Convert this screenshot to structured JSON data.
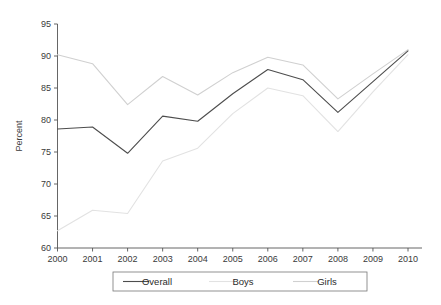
{
  "chart_data": {
    "type": "line",
    "title": "",
    "xlabel": "",
    "ylabel": "Percent",
    "categories": [
      "2000",
      "2001",
      "2002",
      "2003",
      "2004",
      "2005",
      "2006",
      "2007",
      "2008",
      "2009",
      "2010"
    ],
    "x": [
      2000,
      2001,
      2002,
      2003,
      2004,
      2005,
      2006,
      2007,
      2008,
      2009,
      2010
    ],
    "xlim": [
      2000,
      2010
    ],
    "ylim": [
      60,
      95
    ],
    "yticks": [
      60,
      65,
      70,
      75,
      80,
      85,
      90,
      95
    ],
    "ytick_labels": [
      "60",
      "65",
      "70",
      "75",
      "80",
      "85",
      "90",
      "95"
    ],
    "grid": false,
    "legend_position": "bottom",
    "series": [
      {
        "name": "Overall",
        "color": "#4d4d4d",
        "values": [
          78.6,
          78.9,
          74.8,
          80.6,
          79.8,
          84.1,
          87.9,
          86.3,
          81.2,
          86.0,
          90.8
        ]
      },
      {
        "name": "Boys",
        "color": "#e2e2e2",
        "values": [
          62.7,
          65.9,
          65.4,
          73.6,
          75.6,
          81.0,
          85.0,
          83.8,
          78.2,
          84.4,
          90.2
        ]
      },
      {
        "name": "Girls",
        "color": "#d0d0d0",
        "values": [
          90.2,
          88.8,
          82.4,
          86.8,
          83.9,
          87.4,
          89.8,
          88.6,
          83.3,
          87.2,
          91.0
        ]
      }
    ]
  },
  "legend": {
    "items": [
      {
        "label": "Overall"
      },
      {
        "label": "Boys"
      },
      {
        "label": "Girls"
      }
    ]
  }
}
